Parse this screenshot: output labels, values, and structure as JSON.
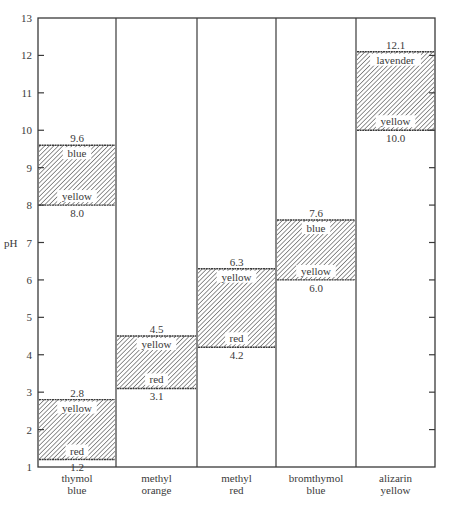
{
  "chart_data": {
    "type": "range-bar",
    "title": "",
    "xlabel": "",
    "ylabel": "pH",
    "ylim": [
      1,
      13
    ],
    "yticks": [
      1,
      2,
      3,
      4,
      5,
      6,
      7,
      8,
      9,
      10,
      11,
      12,
      13
    ],
    "grid": false,
    "legend": null,
    "categories": [
      [
        "thymol",
        "blue"
      ],
      [
        "methyl",
        "orange"
      ],
      [
        "methyl",
        "red"
      ],
      [
        "bromthymol",
        "blue"
      ],
      [
        "alizarin",
        "yellow"
      ]
    ],
    "ranges": [
      {
        "indicator": "thymol blue",
        "low": 1.2,
        "high": 2.8,
        "low_color": "red",
        "high_color": "yellow",
        "low_label": "1.2",
        "high_label": "2.8"
      },
      {
        "indicator": "thymol blue",
        "low": 8.0,
        "high": 9.6,
        "low_color": "yellow",
        "high_color": "blue",
        "low_label": "8.0",
        "high_label": "9.6"
      },
      {
        "indicator": "methyl orange",
        "low": 3.1,
        "high": 4.5,
        "low_color": "red",
        "high_color": "yellow",
        "low_label": "3.1",
        "high_label": "4.5"
      },
      {
        "indicator": "methyl red",
        "low": 4.2,
        "high": 6.3,
        "low_color": "red",
        "high_color": "yellow",
        "low_label": "4.2",
        "high_label": "6.3"
      },
      {
        "indicator": "bromthymol blue",
        "low": 6.0,
        "high": 7.6,
        "low_color": "yellow",
        "high_color": "blue",
        "low_label": "6.0",
        "high_label": "7.6"
      },
      {
        "indicator": "alizarin yellow",
        "low": 10.0,
        "high": 12.1,
        "low_color": "yellow",
        "high_color": "lavender",
        "low_label": "10.0",
        "high_label": "12.1"
      }
    ],
    "colors": {
      "line": "#3a3a3a",
      "hatch": "#555555",
      "background": "#ffffff"
    }
  }
}
